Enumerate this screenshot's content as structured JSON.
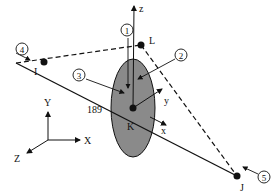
{
  "diagram": {
    "type": "beam element local coordinate system",
    "element_number": "189",
    "nodes": {
      "I": "I",
      "J": "J",
      "K": "K",
      "L": "L"
    },
    "local_axes": {
      "x": "x",
      "y": "y",
      "z": "z"
    },
    "global_axes": {
      "X": "X",
      "Y": "Y",
      "Z": "Z"
    },
    "face_labels": [
      "1",
      "2",
      "3",
      "4",
      "5"
    ],
    "colors": {
      "section_fill": "#8a8a8a",
      "line": "#111111"
    }
  }
}
